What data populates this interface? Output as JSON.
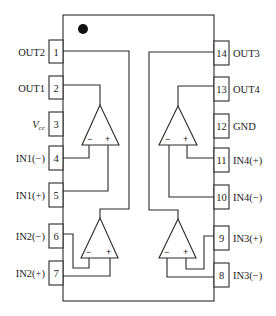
{
  "diagram": {
    "type": "IC pinout (quad op-amp, 14-pin DIP)",
    "orientation_mark": "pin-1 dot",
    "left_pins": [
      {
        "number": "1",
        "label": "OUT2"
      },
      {
        "number": "2",
        "label": "OUT1"
      },
      {
        "number": "3",
        "label": "V",
        "label_sub": "cc"
      },
      {
        "number": "4",
        "label": "IN1(−)"
      },
      {
        "number": "5",
        "label": "IN1(+)"
      },
      {
        "number": "6",
        "label": "IN2(−)"
      },
      {
        "number": "7",
        "label": "IN2(+)"
      }
    ],
    "right_pins": [
      {
        "number": "14",
        "label": "OUT3"
      },
      {
        "number": "13",
        "label": "OUT4"
      },
      {
        "number": "12",
        "label": "GND"
      },
      {
        "number": "11",
        "label": "IN4(+)"
      },
      {
        "number": "10",
        "label": "IN4(−)"
      },
      {
        "number": "9",
        "label": "IN3(+)"
      },
      {
        "number": "8",
        "label": "IN3(−)"
      }
    ],
    "opamps": [
      {
        "name": "op-amp-1",
        "minus": "−",
        "plus": "+"
      },
      {
        "name": "op-amp-2",
        "minus": "−",
        "plus": "+"
      },
      {
        "name": "op-amp-3",
        "minus": "−",
        "plus": "+"
      },
      {
        "name": "op-amp-4",
        "minus": "−",
        "plus": "+"
      }
    ]
  }
}
